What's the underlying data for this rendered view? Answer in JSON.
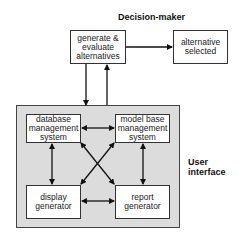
{
  "labels": {
    "decision_maker": "Decision-maker",
    "user_interface_line1": "User",
    "user_interface_line2": "interface"
  },
  "boxes": {
    "generate": {
      "line1": "generate &",
      "line2": "evaluate",
      "line3": "alternatives"
    },
    "selected": {
      "line1": "alternative",
      "line2": "selected"
    },
    "dbms": {
      "line1": "database",
      "line2": "management",
      "line3": "system"
    },
    "mbms": {
      "line1": "model base",
      "line2": "management",
      "line3": "system"
    },
    "display": {
      "line1": "display",
      "line2": "generator"
    },
    "report": {
      "line1": "report",
      "line2": "generator"
    }
  },
  "colors": {
    "panel": "#dcdcdc",
    "stroke": "#111111"
  }
}
